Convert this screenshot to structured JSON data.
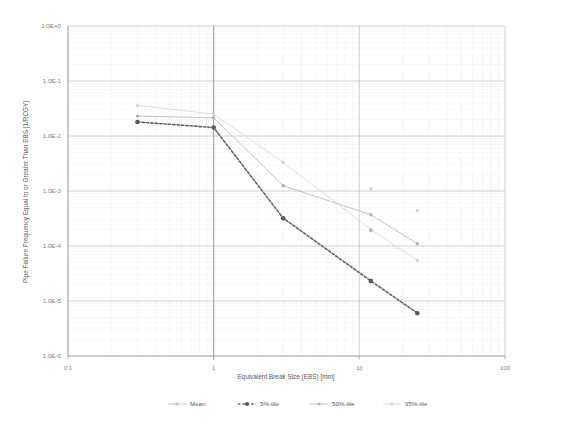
{
  "chart_data": {
    "type": "line",
    "title": "",
    "xlabel": "Equivalent Break Size (EBS) [mm]",
    "ylabel": "Pipe Failure Frequency Equal to or Greater Than EBS [1/RCGY]",
    "xscale": "log",
    "yscale": "log",
    "xlim": [
      0.1,
      100
    ],
    "ylim": [
      1e-06,
      1.0
    ],
    "xticks": [
      "0.1",
      "1",
      "10",
      "100"
    ],
    "xtick_values": [
      0.1,
      1,
      10,
      100
    ],
    "yticks": [
      "1.0E+0",
      "1.0E-1",
      "1.0E-2",
      "1.0E-3",
      "1.0E-4",
      "1.0E-5",
      "1.0E-6"
    ],
    "ytick_values": [
      1.0,
      0.1,
      0.01,
      0.001,
      0.0001,
      1e-05,
      1e-06
    ],
    "grid": true,
    "grid_minor": true,
    "legend_position": "bottom",
    "x": [
      0.3,
      1.0,
      3.0,
      12.0,
      25.0
    ],
    "series": [
      {
        "name": "Mean",
        "color": "#bfbfbf",
        "style": "solid",
        "marker": "circle",
        "values": [
          0.018,
          0.0145,
          0.00033,
          2.4e-05,
          6.2e-06
        ]
      },
      {
        "name": "5%-tile",
        "color": "#595959",
        "style": "dashed",
        "marker": "circle",
        "values": [
          0.018,
          0.0142,
          0.00032,
          2.3e-05,
          6e-06
        ]
      },
      {
        "name": "50%-tile",
        "color": "#b3b3b3",
        "style": "solid",
        "marker": "circle",
        "values": [
          0.023,
          0.0215,
          0.00125,
          0.00037,
          0.00011
        ]
      },
      {
        "name": "95%-tile",
        "color": "#d4d4d4",
        "style": "solid",
        "marker": "circle",
        "values": [
          0.036,
          0.025,
          0.0033,
          0.0002,
          5.5e-05
        ]
      }
    ],
    "extra_markers": [
      {
        "series": "95%-tile",
        "x": 12.0,
        "y": 0.0011
      },
      {
        "series": "50%-tile",
        "x": 12.0,
        "y": 0.00019
      },
      {
        "series": "95%-tile",
        "x": 25.0,
        "y": 0.00044
      }
    ]
  },
  "legend": {
    "items": [
      {
        "label": "Mean"
      },
      {
        "label": "5%-tile"
      },
      {
        "label": "50%-tile"
      },
      {
        "label": "95%-tile"
      }
    ]
  }
}
